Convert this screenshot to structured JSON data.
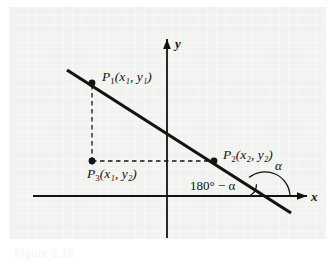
{
  "figure": {
    "background_color": "#f2f2f0",
    "ink_color": "#15130f",
    "axes": {
      "x_label": "x",
      "y_label": "y",
      "origin_x": 167,
      "origin_y": 196
    },
    "line": {
      "description": "straight line with negative slope through P1 and P2",
      "x1": 67,
      "y1": 70,
      "x2": 291,
      "y2": 213,
      "width_px": 3.2
    },
    "points": [
      {
        "name": "P1",
        "label": "P₁(x₁, y₁)",
        "base": "P",
        "sub": "1",
        "coords_text": "(x₁, y₁)",
        "dot_x": 92,
        "dot_y": 83,
        "label_x": 101,
        "label_y": 73
      },
      {
        "name": "P2",
        "label": "P₂(x₂, y₂)",
        "base": "P",
        "sub": "2",
        "coords_text": "(x₂, y₂)",
        "dot_x": 214,
        "dot_y": 161,
        "label_x": 222,
        "label_y": 152
      },
      {
        "name": "P3",
        "label": "P₃(x₁, y₂)",
        "base": "P",
        "sub": "3",
        "coords_text": "(x₁, y₂)",
        "dot_x": 92,
        "dot_y": 162,
        "label_x": 86,
        "label_y": 170
      }
    ],
    "dashed_segments": [
      {
        "name": "vertical-leg",
        "x1": 92,
        "y1": 85,
        "x2": 92,
        "y2": 160
      },
      {
        "name": "horizontal-leg",
        "x1": 94,
        "y1": 161,
        "x2": 212,
        "y2": 161
      }
    ],
    "angles": [
      {
        "name": "alpha",
        "label": "α",
        "label_x": 272,
        "label_y": 167,
        "arc_description": "arc above x-axis opening to the left of the intersection"
      },
      {
        "name": "supplement",
        "label": "180° − α",
        "label_x": 195,
        "label_y": 181,
        "arc_description": "small arc between x-axis and line, left of intersection"
      }
    ],
    "intersection_x": 265,
    "intersection_y": 196
  },
  "caption": {
    "text": "Figure 2.10"
  }
}
